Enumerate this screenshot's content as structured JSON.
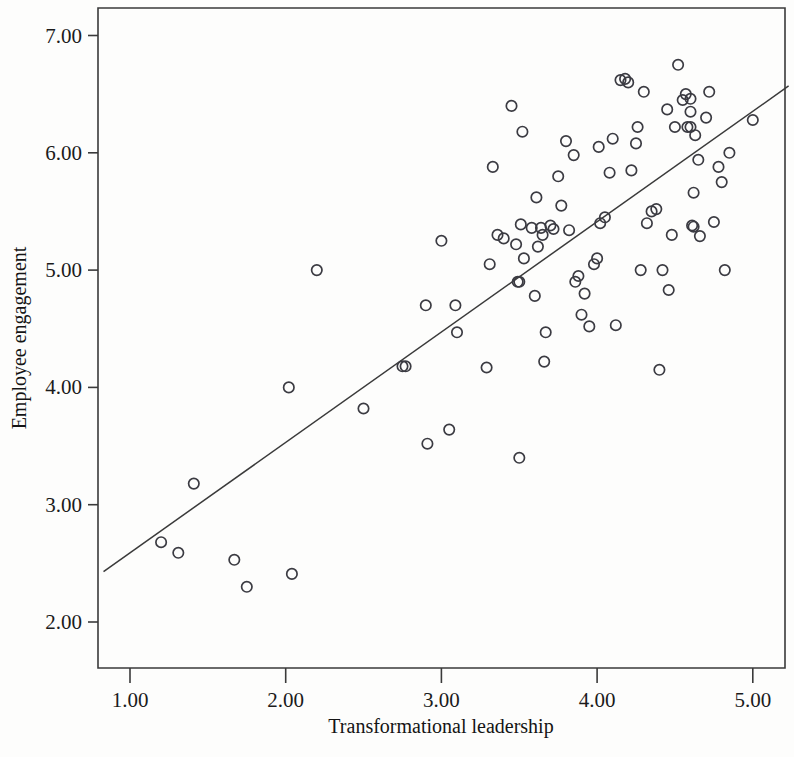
{
  "chart_data": {
    "type": "scatter",
    "title": "",
    "xlabel": "Transformational leadership",
    "ylabel": "Employee engagement",
    "xlim": [
      0.79,
      5.2
    ],
    "ylim": [
      1.82,
      7.35
    ],
    "xticks": [
      1.0,
      2.0,
      3.0,
      4.0,
      5.0
    ],
    "yticks": [
      2.0,
      3.0,
      4.0,
      5.0,
      6.0,
      7.0
    ],
    "xticklabels": [
      "1.00",
      "2.00",
      "3.00",
      "4.00",
      "5.00"
    ],
    "yticklabels": [
      "2.00",
      "3.00",
      "4.00",
      "5.00",
      "6.00",
      "7.00"
    ],
    "grid": false,
    "legend": null,
    "marker": "open-circle",
    "marker_color": "#3b3b42",
    "fit_line": {
      "type": "linear-regression",
      "color": "#3a3a3a",
      "x_start": 0.83,
      "y_start": 2.43,
      "x_end": 5.23,
      "y_end": 6.57
    },
    "x": [
      1.2,
      1.31,
      1.41,
      1.67,
      1.75,
      2.02,
      2.04,
      2.2,
      2.5,
      2.75,
      2.77,
      2.9,
      2.91,
      3.0,
      3.05,
      3.09,
      3.1,
      3.29,
      3.31,
      3.33,
      3.36,
      3.4,
      3.45,
      3.48,
      3.49,
      3.5,
      3.5,
      3.51,
      3.52,
      3.53,
      3.58,
      3.6,
      3.61,
      3.62,
      3.64,
      3.65,
      3.66,
      3.67,
      3.7,
      3.72,
      3.75,
      3.77,
      3.8,
      3.82,
      3.85,
      3.86,
      3.88,
      3.9,
      3.92,
      3.95,
      3.98,
      4.0,
      4.01,
      4.02,
      4.05,
      4.08,
      4.1,
      4.12,
      4.15,
      4.18,
      4.2,
      4.22,
      4.25,
      4.26,
      4.28,
      4.3,
      4.32,
      4.35,
      4.38,
      4.4,
      4.42,
      4.45,
      4.46,
      4.48,
      4.5,
      4.52,
      4.55,
      4.57,
      4.58,
      4.6,
      4.6,
      4.6,
      4.61,
      4.62,
      4.62,
      4.63,
      4.65,
      4.66,
      4.7,
      4.72,
      4.75,
      4.78,
      4.8,
      4.82,
      4.85,
      5.0
    ],
    "y": [
      2.68,
      2.59,
      3.18,
      2.53,
      2.3,
      4.0,
      2.41,
      5.0,
      3.82,
      4.18,
      4.18,
      4.7,
      3.52,
      5.25,
      3.64,
      4.7,
      4.47,
      4.17,
      5.05,
      5.88,
      5.3,
      5.27,
      6.4,
      5.22,
      4.9,
      4.9,
      3.4,
      5.39,
      6.18,
      5.1,
      5.36,
      4.78,
      5.62,
      5.2,
      5.36,
      5.3,
      4.22,
      4.47,
      5.38,
      5.35,
      5.8,
      5.55,
      6.1,
      5.34,
      5.98,
      4.9,
      4.95,
      4.62,
      4.8,
      4.52,
      5.05,
      5.1,
      6.05,
      5.4,
      5.45,
      5.83,
      6.12,
      4.53,
      6.62,
      6.63,
      6.6,
      5.85,
      6.08,
      6.22,
      5.0,
      6.52,
      5.4,
      5.5,
      5.52,
      4.15,
      5.0,
      6.37,
      4.83,
      5.3,
      6.22,
      6.75,
      6.45,
      6.5,
      6.22,
      6.46,
      6.35,
      6.22,
      5.38,
      5.37,
      5.66,
      6.15,
      5.94,
      5.29,
      6.3,
      6.52,
      5.41,
      5.88,
      5.75,
      5.0,
      6.0,
      6.28
    ],
    "point_count": 96
  },
  "axes": {
    "x_title": "Transformational leadership",
    "y_title": "Employee engagement"
  }
}
